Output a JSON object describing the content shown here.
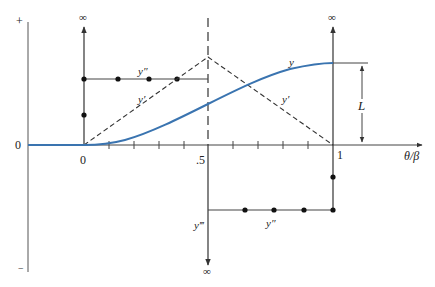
{
  "diagram": {
    "type": "cam-motion-diagram",
    "colors": {
      "curve_y": "#3a74b0",
      "lines": "#333333",
      "text": "#222222"
    },
    "axes": {
      "vertical_axis": {
        "top_label": "+",
        "zero_label": "0",
        "bottom_label": "−"
      },
      "horizontal_axis": {
        "label": "θ/β",
        "tick_labels": {
          "start": "0",
          "mid": ".5",
          "end": "1"
        },
        "ticks": [
          0,
          0.1,
          0.2,
          0.3,
          0.4,
          0.5,
          0.6,
          0.7,
          0.8,
          0.9,
          1.0
        ]
      }
    },
    "curves": {
      "displacement": {
        "label": "y",
        "style": "solid-blue",
        "description": "cycloidal-like rise from 0 to L over θ/β 0→1"
      },
      "velocity": {
        "label": "y′",
        "style": "dashed",
        "description": "triangular: rises linearly to peak at .5, falls to 0 at 1"
      },
      "acceleration_upper": {
        "label": "y″",
        "style": "solid-with-dots",
        "description": "constant positive from 0 to .5"
      },
      "acceleration_lower": {
        "label": "y″",
        "style": "solid-with-dots",
        "description": "constant negative from .5 to 1"
      },
      "jerk": {
        "label": "y‴",
        "description": "impulses (∞) at 0, .5 and 1"
      }
    },
    "infinity_labels": {
      "at_start_up": "∞",
      "at_mid_down": "∞",
      "at_end_up": "∞"
    },
    "dimension": {
      "label": "L"
    }
  }
}
